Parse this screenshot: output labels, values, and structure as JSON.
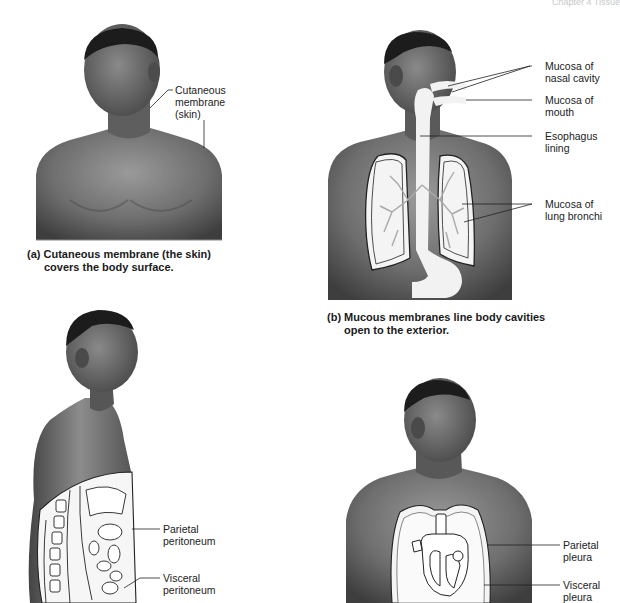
{
  "page_header": "Chapter 4  Tissue",
  "panels": {
    "a": {
      "caption_line1": "(a) Cutaneous membrane (the skin)",
      "caption_line2": "covers the body surface.",
      "labels": [
        {
          "text": "Cutaneous\nmembrane\n(skin)"
        }
      ]
    },
    "b": {
      "caption_line1": "(b) Mucous membranes line body cavities",
      "caption_line2": "open to the exterior.",
      "labels": [
        {
          "text": "Mucosa of\nnasal cavity"
        },
        {
          "text": "Mucosa of\nmouth"
        },
        {
          "text": "Esophagus\nlining"
        },
        {
          "text": "Mucosa of\nlung bronchi"
        }
      ]
    },
    "c": {
      "labels": [
        {
          "text": "Parietal\nperitoneum"
        },
        {
          "text": "Visceral\nperitoneum"
        }
      ]
    },
    "d": {
      "labels": [
        {
          "text": "Parietal\npleura"
        },
        {
          "text": "Visceral\npleura"
        }
      ]
    }
  },
  "colors": {
    "skin_dark": "#3e3e3e",
    "skin_mid": "#6e6e6e",
    "skin_light": "#9a9a9a",
    "hair": "#1c1c1c",
    "membrane_fill": "#f4f4f4",
    "outline": "#222222"
  }
}
